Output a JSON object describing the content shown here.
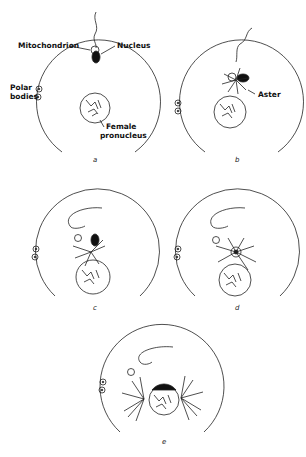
{
  "figure": {
    "panels": [
      {
        "id": "a",
        "label": "a"
      },
      {
        "id": "b",
        "label": "b"
      },
      {
        "id": "c",
        "label": "c"
      },
      {
        "id": "d",
        "label": "d"
      },
      {
        "id": "e",
        "label": "e"
      }
    ],
    "annotations": {
      "mitochondrion": "Mitochondrion",
      "nucleus": "Nucleus",
      "polar_bodies_1": "Polar",
      "polar_bodies_2": "bodies",
      "female_pronucleus_1": "Female",
      "female_pronucleus_2": "pronucleus",
      "aster": "Aster"
    },
    "colors": {
      "ink": "#111111",
      "background": "#ffffff"
    }
  }
}
